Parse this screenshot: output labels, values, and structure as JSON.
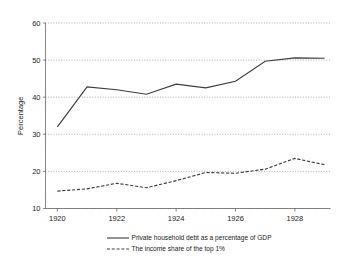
{
  "chart_data": {
    "type": "line",
    "title": "",
    "xlabel": "",
    "ylabel": "Percentage",
    "xlim": [
      1919.6,
      1929.2
    ],
    "ylim": [
      10,
      60
    ],
    "grid": true,
    "grid_axis": "y",
    "legend_position": "bottom",
    "x": [
      1920,
      1921,
      1922,
      1923,
      1924,
      1925,
      1926,
      1927,
      1928,
      1929
    ],
    "xticks": [
      1920,
      1922,
      1924,
      1926,
      1928
    ],
    "xtick_labels": [
      "1920",
      "1922",
      "1924",
      "1926",
      "1928"
    ],
    "yticks": [
      10,
      20,
      30,
      40,
      50,
      60
    ],
    "ytick_labels": [
      "10",
      "20",
      "30",
      "40",
      "50",
      "60"
    ],
    "series": [
      {
        "name": "Private household debt as a percentage of GDP",
        "style": "solid",
        "color": "#3d3d3d",
        "values": [
          32.0,
          42.8,
          42.0,
          40.8,
          43.5,
          42.5,
          44.3,
          49.7,
          50.6,
          50.5
        ]
      },
      {
        "name": "The income share of the top 1%",
        "style": "dashed",
        "color": "#3d3d3d",
        "values": [
          14.7,
          15.3,
          16.8,
          15.6,
          17.5,
          19.7,
          19.5,
          20.6,
          23.5,
          21.8
        ]
      }
    ]
  },
  "legend": {
    "items": [
      {
        "label": "Private household debt as a percentage of GDP",
        "style": "solid"
      },
      {
        "label": "The income share of the top 1%",
        "style": "dashed"
      }
    ]
  },
  "axes": {
    "y_axis_title": "Percentage"
  }
}
